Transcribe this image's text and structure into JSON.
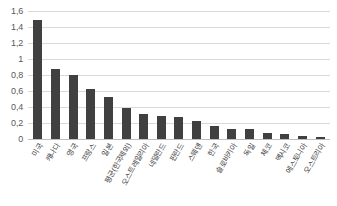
{
  "chart_data": {
    "type": "bar",
    "title": "",
    "subtitle": "",
    "xlabel": "",
    "ylabel": "",
    "ylim": [
      0,
      1.6
    ],
    "grid": true,
    "legend": false,
    "decimal_separator": ",",
    "yticks": [
      "0",
      "0,2",
      "0,4",
      "0,6",
      "0,8",
      "1",
      "1,2",
      "1,4",
      "1,6"
    ],
    "ytick_values": [
      0,
      0.2,
      0.4,
      0.6,
      0.8,
      1.0,
      1.2,
      1.4,
      1.6
    ],
    "categories": [
      "미국",
      "캐나다",
      "영국",
      "프랑스",
      "일본",
      "평균(한국제외)",
      "오스트레일리아",
      "네덜란드",
      "핀란드",
      "스웨덴",
      "한국",
      "슬로바키아",
      "독일",
      "체코",
      "멕시코",
      "에스토니아",
      "오스트리아"
    ],
    "values": [
      1.49,
      0.88,
      0.8,
      0.62,
      0.53,
      0.39,
      0.31,
      0.29,
      0.27,
      0.22,
      0.16,
      0.13,
      0.13,
      0.08,
      0.06,
      0.04,
      0.03
    ],
    "bar_color": "#404040",
    "grid_color": "#d9d9d9",
    "axis_text_color": "#595959",
    "background_color": "#ffffff"
  }
}
